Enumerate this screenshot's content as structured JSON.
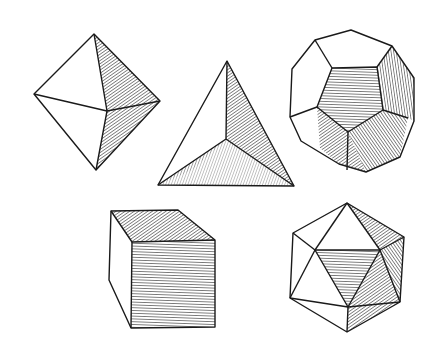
{
  "figure": {
    "solids": [
      {
        "name": "octahedron",
        "faces": 8
      },
      {
        "name": "tetrahedron",
        "faces": 4
      },
      {
        "name": "dodecahedron",
        "faces": 12
      },
      {
        "name": "cube",
        "faces": 6
      },
      {
        "name": "icosahedron",
        "faces": 20
      }
    ],
    "style": {
      "line": "#1a1a1a",
      "background": "#ffffff",
      "hatch": "#2a2a2a"
    }
  }
}
